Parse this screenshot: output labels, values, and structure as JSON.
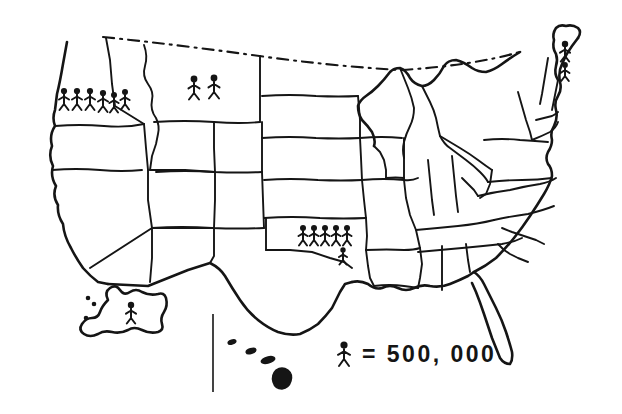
{
  "map": {
    "title": "United States Population Pictogram Map",
    "style": "hand-drawn",
    "line_color": "#151515",
    "background_color": "#ffffff",
    "northern_border_style": "dashed"
  },
  "legend": {
    "symbol": "stick-figure",
    "equals_sign": "=",
    "value_text": "500, 000",
    "full_text": "= 500, 000",
    "unit": "people",
    "symbol_value": 500000
  },
  "pictogram_data": {
    "type": "pictogram",
    "symbol_value": 500000,
    "symbol_label": "stick-figure",
    "regions": [
      {
        "name": "Washington",
        "figure_count": 6,
        "population": 3000000,
        "rows": [
          6
        ],
        "x": 58,
        "y": 86
      },
      {
        "name": "Montana",
        "figure_count": 2,
        "population": 1000000,
        "rows": [
          2
        ],
        "x": 186,
        "y": 70
      },
      {
        "name": "Oklahoma",
        "figure_count": 6,
        "population": 3000000,
        "rows": [
          5,
          1
        ],
        "x": 296,
        "y": 222
      },
      {
        "name": "Maine",
        "figure_count": 2,
        "population": 1000000,
        "rows": [
          1,
          1
        ],
        "x": 560,
        "y": 40
      },
      {
        "name": "Alaska",
        "figure_count": 1,
        "population": 500000,
        "rows": [
          1
        ],
        "x": 127,
        "y": 300
      }
    ],
    "regions_without_figures": [
      "California",
      "Oregon",
      "Nevada",
      "Idaho",
      "Utah",
      "Arizona",
      "Wyoming",
      "Colorado",
      "New Mexico",
      "North Dakota",
      "South Dakota",
      "Nebraska",
      "Kansas",
      "Texas",
      "Minnesota",
      "Iowa",
      "Missouri",
      "Arkansas",
      "Louisiana",
      "Wisconsin",
      "Illinois",
      "Michigan",
      "Indiana",
      "Ohio",
      "Kentucky",
      "Tennessee",
      "Mississippi",
      "Alabama",
      "Georgia",
      "Florida",
      "South Carolina",
      "North Carolina",
      "Virginia",
      "West Virginia",
      "Pennsylvania",
      "New York",
      "Vermont",
      "New Hampshire",
      "Massachusetts",
      "Hawaii"
    ]
  },
  "inset": {
    "alaska_label": "Alaska",
    "hawaii_label": "Hawaii"
  }
}
